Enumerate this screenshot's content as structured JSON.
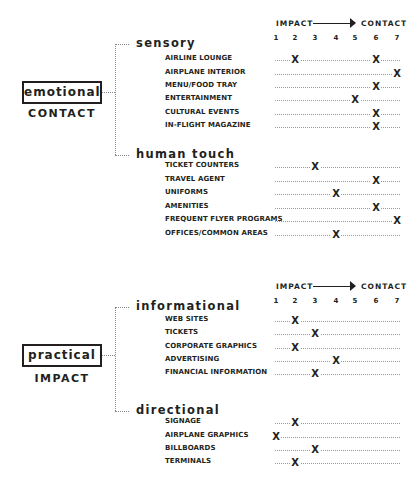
{
  "scale": {
    "left_label": "IMPACT",
    "right_label": "CONTACT",
    "numbers": [
      "1",
      "2",
      "3",
      "4",
      "5",
      "6",
      "7"
    ]
  },
  "mark_symbol": "X",
  "groups": [
    {
      "box_label": "emotional",
      "sub_label": "CONTACT",
      "categories": [
        {
          "heading": "sensory",
          "items": [
            {
              "label": "AIRLINE LOUNGE",
              "marks": [
                2,
                6
              ]
            },
            {
              "label": "AIRPLANE INTERIOR",
              "marks": [
                7
              ]
            },
            {
              "label": "MENU/FOOD TRAY",
              "marks": [
                6
              ]
            },
            {
              "label": "ENTERTAINMENT",
              "marks": [
                5
              ]
            },
            {
              "label": "CULTURAL EVENTS",
              "marks": [
                6
              ]
            },
            {
              "label": "IN-FLIGHT MAGAZINE",
              "marks": [
                6
              ]
            }
          ]
        },
        {
          "heading": "human touch",
          "items": [
            {
              "label": "TICKET COUNTERS",
              "marks": [
                3
              ]
            },
            {
              "label": "TRAVEL AGENT",
              "marks": [
                6
              ]
            },
            {
              "label": "UNIFORMS",
              "marks": [
                4
              ]
            },
            {
              "label": "AMENITIES",
              "marks": [
                6
              ]
            },
            {
              "label": "FREQUENT FLYER PROGRAMS",
              "marks": [
                7
              ]
            },
            {
              "label": "OFFICES/COMMON AREAS",
              "marks": [
                4
              ]
            }
          ]
        }
      ]
    },
    {
      "box_label": "practical",
      "sub_label": "IMPACT",
      "categories": [
        {
          "heading": "informational",
          "items": [
            {
              "label": "WEB SITES",
              "marks": [
                2
              ]
            },
            {
              "label": "TICKETS",
              "marks": [
                3
              ]
            },
            {
              "label": "CORPORATE GRAPHICS",
              "marks": [
                2
              ]
            },
            {
              "label": "ADVERTISING",
              "marks": [
                4
              ]
            },
            {
              "label": "FINANCIAL INFORMATION",
              "marks": [
                3
              ]
            }
          ]
        },
        {
          "heading": "directional",
          "items": [
            {
              "label": "SIGNAGE",
              "marks": [
                2
              ]
            },
            {
              "label": "AIRPLANE GRAPHICS",
              "marks": [
                1
              ]
            },
            {
              "label": "BILLBOARDS",
              "marks": [
                3
              ]
            },
            {
              "label": "TERMINALS",
              "marks": [
                2
              ]
            }
          ]
        }
      ]
    }
  ]
}
